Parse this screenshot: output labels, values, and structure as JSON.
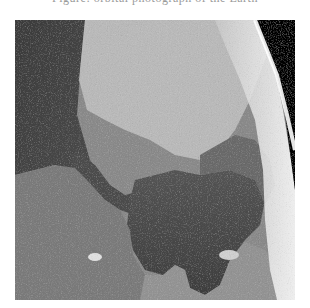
{
  "caption": {
    "text": "Figure: orbital photograph of the Earth",
    "visible": "clipped descenders only"
  },
  "photo": {
    "description": "Grayscale orbital photograph of Earth's surface showing a narrow strait opening into a large dark inland sea, land masses on both sides, bright clouds and atmospheric haze along the curved horizon, and black space in the upper right",
    "tone": "grayscale",
    "colors": {
      "space": "#050505",
      "haze": "#f2f2f2",
      "bright_land": "#bdbdbd",
      "mid_land": "#8f8f8f",
      "dark_land": "#6e6e6e",
      "sea": "#4a4a4a",
      "deep_water": "#3a3a3a"
    }
  }
}
